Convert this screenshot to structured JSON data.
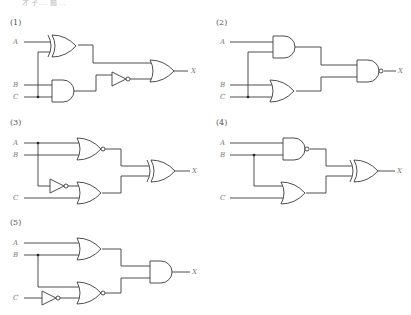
{
  "header": {
    "cut_off_text": "才 子 … 题 …"
  },
  "circuits": [
    {
      "id": "(1)",
      "inputs": [
        "A",
        "B",
        "C"
      ],
      "output": "X",
      "gates": [
        "XOR(A,C)",
        "AND(B,C)",
        "NOT(AND)",
        "OR(XOR, NOT)"
      ]
    },
    {
      "id": "(2)",
      "inputs": [
        "A",
        "B",
        "C"
      ],
      "output": "X",
      "gates": [
        "AND(A,C)",
        "OR(B,C)",
        "NAND(AND, OR)"
      ]
    },
    {
      "id": "(3)",
      "inputs": [
        "A",
        "B",
        "C"
      ],
      "output": "X",
      "gates": [
        "NOR(A,B)",
        "NOT(A)",
        "NOR(NOT A, C)",
        "XOR(NOR1, NOR2)"
      ]
    },
    {
      "id": "(4)",
      "inputs": [
        "A",
        "B",
        "C"
      ],
      "output": "X",
      "gates": [
        "NAND(A,B)",
        "OR(B,C)",
        "XOR(NAND, OR)"
      ]
    },
    {
      "id": "(5)",
      "inputs": [
        "A",
        "B",
        "C"
      ],
      "output": "X",
      "gates": [
        "OR(A,B)",
        "NOT(C)",
        "NOR(B, NOT C)",
        "AND(OR, NOR)"
      ]
    }
  ],
  "colors": {
    "line": "#3a3a3a",
    "label": "#777777"
  }
}
